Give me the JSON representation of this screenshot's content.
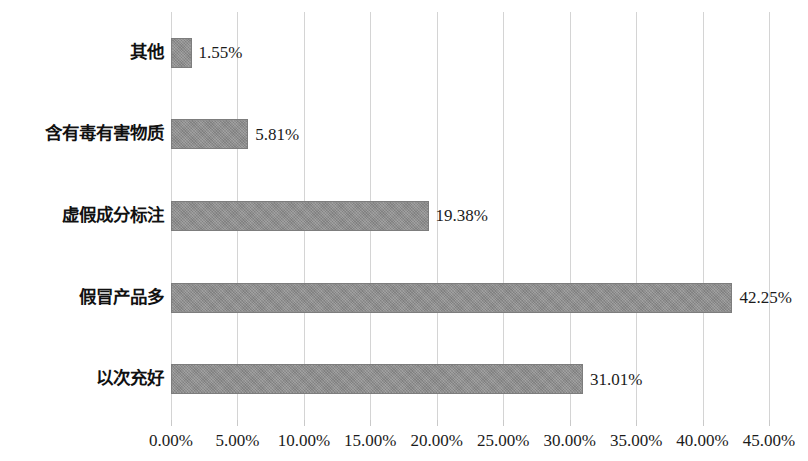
{
  "chart_data": {
    "type": "bar",
    "orientation": "horizontal",
    "title": "",
    "subtitle": "",
    "xlabel": "",
    "ylabel": "",
    "xlim": [
      0,
      45
    ],
    "ylim": null,
    "grid": true,
    "grid_axis": "x",
    "legend": false,
    "legend_position": "none",
    "categories": [
      "以次充好",
      "假冒产品多",
      "虚假成分标注",
      "含有毒有害物质",
      "其他"
    ],
    "values": [
      31.01,
      42.25,
      19.38,
      5.81,
      1.55
    ],
    "value_labels": [
      "31.01%",
      "42.25%",
      "19.38%",
      "5.81%",
      "1.55%"
    ],
    "xticks": [
      0,
      5,
      10,
      15,
      20,
      25,
      30,
      35,
      40,
      45
    ],
    "xtick_labels": [
      "0.00%",
      "5.00%",
      "10.00%",
      "15.00%",
      "20.00%",
      "25.00%",
      "30.00%",
      "35.00%",
      "40.00%",
      "45.00%"
    ],
    "series": [
      {
        "name": "",
        "color": "#8d8d8d",
        "values": [
          31.01,
          42.25,
          19.38,
          5.81,
          1.55
        ]
      }
    ]
  },
  "colors": {
    "bar_fill": "#8d8d8d",
    "bar_border": "#7d7d7d",
    "gridline": "#d4d4d4",
    "text": "#1b1b1b",
    "background": "#ffffff"
  },
  "bars_top_to_bottom": [
    {
      "category": "其他",
      "value": 1.55,
      "label": "1.55%"
    },
    {
      "category": "含有毒有害物质",
      "value": 5.81,
      "label": "5.81%"
    },
    {
      "category": "虚假成分标注",
      "value": 19.38,
      "label": "19.38%"
    },
    {
      "category": "假冒产品多",
      "value": 42.25,
      "label": "42.25%"
    },
    {
      "category": "以次充好",
      "value": 31.01,
      "label": "31.01%"
    }
  ]
}
